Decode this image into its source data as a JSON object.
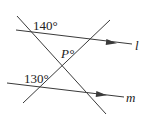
{
  "diagram": {
    "type": "geometry-parallel-lines-transversals",
    "angles": {
      "top_left": "140°",
      "center": "P°",
      "bottom_left": "130°"
    },
    "lines": {
      "upper_parallel": "l",
      "lower_parallel": "m"
    },
    "colors": {
      "stroke": "#3a3a3a",
      "text": "#222222",
      "background": "#ffffff"
    }
  }
}
